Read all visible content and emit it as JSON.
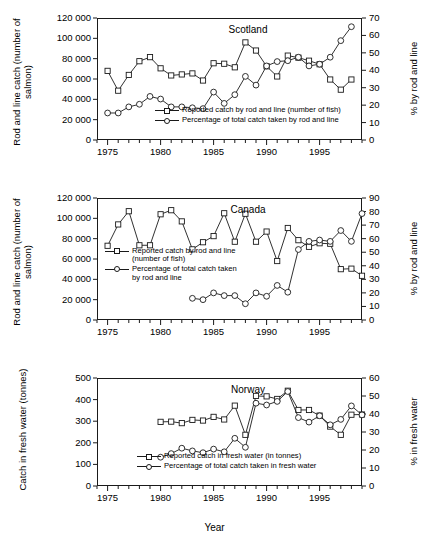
{
  "figure": {
    "xaxis_title": "Year",
    "background": "#ffffff",
    "line_color": "#1a1a1a"
  },
  "chart_data": [
    {
      "type": "line",
      "title": "Scotland",
      "xlabel": "",
      "ylabel": "Rod and line catch (number of salmon)",
      "ylabel_right": "% by rod and line",
      "xlim": [
        1974,
        1999
      ],
      "ylim": [
        0,
        120000
      ],
      "ylim_right": [
        0,
        70
      ],
      "xticks": [
        1975,
        1980,
        1985,
        1990,
        1995
      ],
      "xtick_labels": [
        "1975",
        "1980",
        "1985",
        "1990",
        "1995"
      ],
      "yticks": [
        0,
        20000,
        40000,
        60000,
        80000,
        100000,
        120000
      ],
      "ytick_labels": [
        "0",
        "20 000",
        "40 000",
        "60 000",
        "80 000",
        "100 000",
        "120 000"
      ],
      "yticks_right": [
        0,
        10,
        20,
        30,
        40,
        50,
        60,
        70
      ],
      "ytick_labels_right": [
        "0",
        "10",
        "20",
        "30",
        "40",
        "50",
        "60",
        "70"
      ],
      "grid": false,
      "legend_position": "lower-right-inside",
      "series": [
        {
          "name": "Reported catch by rod and line (number of fish)",
          "marker": "square",
          "axis": "left",
          "x": [
            1975,
            1976,
            1977,
            1978,
            1979,
            1980,
            1981,
            1982,
            1983,
            1984,
            1985,
            1986,
            1987,
            1988,
            1989,
            1990,
            1991,
            1992,
            1993,
            1994,
            1995,
            1996,
            1997,
            1998
          ],
          "values": [
            68000,
            48500,
            64000,
            77500,
            81500,
            70500,
            63500,
            64500,
            65500,
            58500,
            75500,
            75000,
            71500,
            96000,
            88000,
            72500,
            62500,
            83000,
            81000,
            78000,
            74500,
            59500,
            49500,
            59500
          ]
        },
        {
          "name": "Percentage of total catch taken by rod and line",
          "marker": "circle",
          "axis": "right",
          "x": [
            1975,
            1976,
            1977,
            1978,
            1979,
            1980,
            1981,
            1982,
            1983,
            1984,
            1985,
            1986,
            1987,
            1988,
            1989,
            1990,
            1991,
            1992,
            1993,
            1994,
            1995,
            1996,
            1997,
            1998
          ],
          "values": [
            15.5,
            15.5,
            19.0,
            20.5,
            25.0,
            23.5,
            19.0,
            19.0,
            18.5,
            18.0,
            27.5,
            21.0,
            26.0,
            36.5,
            31.5,
            42.5,
            45.0,
            45.5,
            47.5,
            42.5,
            43.5,
            47.5,
            57.0,
            65.0
          ]
        }
      ]
    },
    {
      "type": "line",
      "title": "Canada",
      "xlabel": "",
      "ylabel": "Rod and line catch (number of salmon)",
      "ylabel_right": "% by rod and line",
      "xlim": [
        1974,
        1999
      ],
      "ylim": [
        0,
        120000
      ],
      "ylim_right": [
        0,
        90
      ],
      "xticks": [
        1975,
        1980,
        1985,
        1990,
        1995
      ],
      "xtick_labels": [
        "1975",
        "1980",
        "1985",
        "1990",
        "1995"
      ],
      "yticks": [
        0,
        20000,
        40000,
        60000,
        80000,
        100000,
        120000
      ],
      "ytick_labels": [
        "0",
        "20 000",
        "40 000",
        "60 000",
        "80 000",
        "100 000",
        "120 000"
      ],
      "yticks_right": [
        0,
        10,
        20,
        30,
        40,
        50,
        60,
        70,
        80,
        90
      ],
      "ytick_labels_right": [
        "0",
        "10",
        "20",
        "30",
        "40",
        "50",
        "60",
        "70",
        "80",
        "90"
      ],
      "grid": false,
      "legend_position": "middle-left-inside",
      "series": [
        {
          "name": "Reported catch by rod and line (number of fish)",
          "marker": "square",
          "axis": "left",
          "x": [
            1975,
            1976,
            1977,
            1978,
            1979,
            1980,
            1981,
            1982,
            1983,
            1984,
            1985,
            1986,
            1987,
            1988,
            1989,
            1990,
            1991,
            1992,
            1993,
            1994,
            1995,
            1996,
            1997,
            1998,
            1999
          ],
          "values": [
            73000,
            94000,
            107000,
            73500,
            73500,
            104000,
            108000,
            97000,
            69500,
            76500,
            82500,
            105000,
            77000,
            104500,
            77000,
            87000,
            58000,
            90500,
            78500,
            72000,
            75500,
            75000,
            50000,
            50500,
            43500
          ]
        },
        {
          "name": "Percentage of total catch taken by rod and line",
          "marker": "circle",
          "axis": "right",
          "x": [
            1983,
            1984,
            1985,
            1986,
            1987,
            1988,
            1989,
            1990,
            1991,
            1992,
            1993,
            1994,
            1995,
            1996,
            1997,
            1998,
            1999
          ],
          "values": [
            16.0,
            15.0,
            20.0,
            18.0,
            18.0,
            12.0,
            20.0,
            17.5,
            25.5,
            20.5,
            52.0,
            58.0,
            59.0,
            58.0,
            66.0,
            58.0,
            78.5,
            76.0
          ]
        }
      ]
    },
    {
      "type": "line",
      "title": "Norway",
      "xlabel": "Year",
      "ylabel": "Catch in fresh water (tonnes)",
      "ylabel_right": "% in fresh water",
      "xlim": [
        1974,
        1999
      ],
      "ylim": [
        0,
        500
      ],
      "ylim_right": [
        0,
        60
      ],
      "xticks": [
        1975,
        1980,
        1985,
        1990,
        1995
      ],
      "xtick_labels": [
        "1975",
        "1980",
        "1985",
        "1990",
        "1995"
      ],
      "yticks": [
        0,
        100,
        200,
        300,
        400,
        500
      ],
      "ytick_labels": [
        "0",
        "100",
        "200",
        "300",
        "400",
        "500"
      ],
      "yticks_right": [
        0,
        10,
        20,
        30,
        40,
        50,
        60
      ],
      "ytick_labels_right": [
        "0",
        "10",
        "20",
        "30",
        "40",
        "50",
        "60"
      ],
      "grid": false,
      "legend_position": "lower-center-inside",
      "series": [
        {
          "name": "Reported catch in fresh water (in tonnes)",
          "marker": "square",
          "axis": "left",
          "x": [
            1980,
            1981,
            1982,
            1983,
            1984,
            1985,
            1986,
            1987,
            1988,
            1989,
            1990,
            1991,
            1992,
            1993,
            1994,
            1995,
            1996,
            1997,
            1998,
            1999
          ],
          "values": [
            297,
            298,
            291,
            306,
            303,
            320,
            308,
            372,
            237,
            417,
            415,
            403,
            441,
            352,
            352,
            326,
            275,
            237,
            330,
            331
          ]
        },
        {
          "name": "Percentage of total catch taken in fresh water",
          "marker": "circle",
          "axis": "right",
          "x": [
            1980,
            1981,
            1982,
            1983,
            1984,
            1985,
            1986,
            1987,
            1988,
            1989,
            1990,
            1991,
            1992,
            1993,
            1994,
            1995,
            1996,
            1997,
            1998,
            1999
          ],
          "values": [
            16.0,
            18.0,
            21.0,
            19.5,
            18.5,
            20.5,
            19.0,
            26.5,
            21.5,
            46.0,
            45.0,
            47.0,
            52.5,
            38.0,
            35.5,
            39.0,
            34.0,
            37.0,
            44.5,
            39.5
          ]
        }
      ]
    }
  ]
}
